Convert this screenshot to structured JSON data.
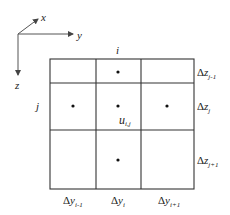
{
  "axes": {
    "x_label": "x",
    "y_label": "y",
    "z_label": "z"
  },
  "grid": {
    "column_index_label": "i",
    "row_index_label": "j",
    "center_label_main": "u",
    "center_label_sub": "i,j",
    "row_spacing_labels": [
      {
        "delta": "Δ",
        "var": "z",
        "sub": "j-1"
      },
      {
        "delta": "Δ",
        "var": "z",
        "sub": "j"
      },
      {
        "delta": "Δ",
        "var": "z",
        "sub": "j+1"
      }
    ],
    "column_spacing_labels": [
      {
        "delta": "Δ",
        "var": "y",
        "sub": "i-1"
      },
      {
        "delta": "Δ",
        "var": "y",
        "sub": "i"
      },
      {
        "delta": "Δ",
        "var": "y",
        "sub": "i+1"
      }
    ],
    "line_color": "#333333",
    "dot_color": "#111111"
  }
}
